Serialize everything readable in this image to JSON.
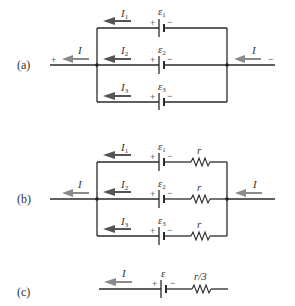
{
  "diagram": {
    "panels": [
      {
        "label": "(a)",
        "external_current": "I",
        "left_terminal_sign": "+",
        "right_terminal_sign": "−",
        "branches": [
          {
            "current": "I",
            "current_sub": "1",
            "emf": "ε",
            "emf_sub": "1",
            "plus": "+",
            "minus": "−"
          },
          {
            "current": "I",
            "current_sub": "2",
            "emf": "ε",
            "emf_sub": "2",
            "plus": "+",
            "minus": "−"
          },
          {
            "current": "I",
            "current_sub": "3",
            "emf": "ε",
            "emf_sub": "3",
            "plus": "+",
            "minus": "−"
          }
        ]
      },
      {
        "label": "(b)",
        "external_current": "I",
        "branches": [
          {
            "current": "I",
            "current_sub": "1",
            "emf": "ε",
            "emf_sub": "1",
            "plus": "+",
            "minus": "−",
            "resistor": "r"
          },
          {
            "current": "I",
            "current_sub": "2",
            "emf": "ε",
            "emf_sub": "2",
            "plus": "+",
            "minus": "−",
            "resistor": "r"
          },
          {
            "current": "I",
            "current_sub": "3",
            "emf": "ε",
            "emf_sub": "3",
            "plus": "+",
            "minus": "−",
            "resistor": "r"
          }
        ]
      },
      {
        "label": "(c)",
        "current": "I",
        "emf": "ε",
        "plus": "+",
        "minus": "−",
        "resistor": "r/3"
      }
    ]
  }
}
